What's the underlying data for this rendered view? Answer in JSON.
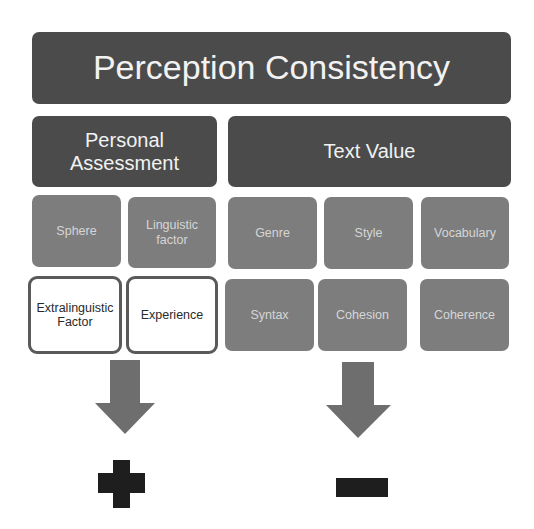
{
  "title": "Perception Consistency",
  "categories": {
    "personal": {
      "label_line1": "Personal",
      "label_line2": "Assessment"
    },
    "text": {
      "label": "Text Value"
    }
  },
  "personal_factors": {
    "row1": [
      {
        "label": "Sphere"
      },
      {
        "label_line1": "Linguistic",
        "label_line2": "factor"
      }
    ],
    "row2": [
      {
        "label_line1": "Extralinguistic",
        "label_line2": "Factor"
      },
      {
        "label": "Experience"
      }
    ]
  },
  "text_factors": {
    "row1": [
      {
        "label": "Genre"
      },
      {
        "label": "Style"
      },
      {
        "label": "Vocabulary"
      }
    ],
    "row2": [
      {
        "label": "Syntax"
      },
      {
        "label": "Cohesion"
      },
      {
        "label": "Coherence"
      }
    ]
  },
  "outcomes": {
    "personal": {
      "symbol": "plus",
      "meaning": "+"
    },
    "text": {
      "symbol": "minus",
      "meaning": "-"
    }
  },
  "colors": {
    "dark_box": "#4b4b4b",
    "mid_box": "#7d7d7d",
    "arrow": "#6e6e6e",
    "symbol": "#1e1e1e"
  }
}
